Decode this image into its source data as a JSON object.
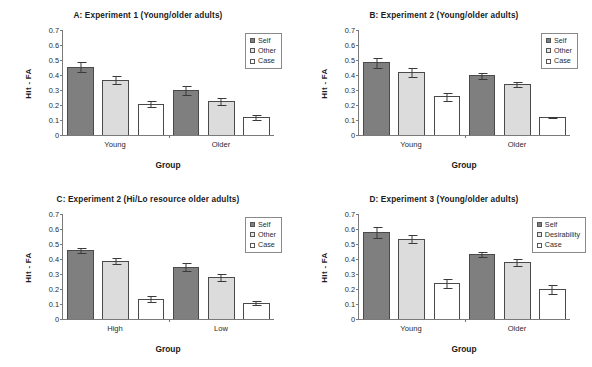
{
  "figure": {
    "panel_count": 4,
    "y_ticks": [
      "0.7",
      "0.6",
      "0.5",
      "0.4",
      "0.3",
      "0.2",
      "0.1",
      "0"
    ],
    "ylabel": "Hit - FA",
    "xlabel": "Group"
  },
  "panels": [
    {
      "id": "A",
      "title": "A:  Experiment 1 (Young/older adults)",
      "legend": [
        "Self",
        "Other",
        "Case"
      ],
      "categories": [
        "Young",
        "Older"
      ]
    },
    {
      "id": "B",
      "title": "B:  Experiment 2 (Young/older adults)",
      "legend": [
        "Self",
        "Other",
        "Case"
      ],
      "categories": [
        "Young",
        "Older"
      ]
    },
    {
      "id": "C",
      "title": "C:  Experiment 2 (Hi/Lo resource older adults)",
      "legend": [
        "Self",
        "Other",
        "Case"
      ],
      "categories": [
        "High",
        "Low"
      ]
    },
    {
      "id": "D",
      "title": "D:  Experiment 3 (Young/older adults)",
      "legend": [
        "Self",
        "Desirability",
        "Case"
      ],
      "categories": [
        "Young",
        "Older"
      ]
    }
  ],
  "chart_data": [
    {
      "type": "bar",
      "panel": "A",
      "title": "A:  Experiment 1 (Young/older adults)",
      "xlabel": "Group",
      "ylabel": "Hit - FA",
      "ylim": [
        0,
        0.7
      ],
      "ytick_step": 0.1,
      "grid": false,
      "legend_position": "top-right",
      "categories": [
        "Young",
        "Older"
      ],
      "series": [
        {
          "name": "Self",
          "color": "#7f7f7f",
          "values": [
            0.455,
            0.3
          ],
          "errors": [
            0.035,
            0.03
          ]
        },
        {
          "name": "Other",
          "color": "#dcdcdc",
          "values": [
            0.37,
            0.225
          ],
          "errors": [
            0.03,
            0.025
          ]
        },
        {
          "name": "Case",
          "color": "#ffffff",
          "values": [
            0.21,
            0.12
          ],
          "errors": [
            0.022,
            0.02
          ]
        }
      ]
    },
    {
      "type": "bar",
      "panel": "B",
      "title": "B:  Experiment 2 (Young/older adults)",
      "xlabel": "Group",
      "ylabel": "Hit - FA",
      "ylim": [
        0,
        0.7
      ],
      "ytick_step": 0.1,
      "grid": false,
      "legend_position": "top-right",
      "categories": [
        "Young",
        "Older"
      ],
      "series": [
        {
          "name": "Self",
          "color": "#7f7f7f",
          "values": [
            0.485,
            0.397
          ],
          "errors": [
            0.035,
            0.025
          ]
        },
        {
          "name": "Other",
          "color": "#dcdcdc",
          "values": [
            0.418,
            0.337
          ],
          "errors": [
            0.033,
            0.02
          ]
        },
        {
          "name": "Case",
          "color": "#ffffff",
          "values": [
            0.258,
            0.12
          ],
          "errors": [
            0.03,
            0.008
          ]
        }
      ]
    },
    {
      "type": "bar",
      "panel": "C",
      "title": "C:  Experiment 2 (Hi/Lo resource older adults)",
      "xlabel": "Group",
      "ylabel": "Hit - FA",
      "ylim": [
        0,
        0.7
      ],
      "ytick_step": 0.1,
      "grid": false,
      "legend_position": "top-right",
      "categories": [
        "High",
        "Low"
      ],
      "series": [
        {
          "name": "Self",
          "color": "#7f7f7f",
          "values": [
            0.458,
            0.35
          ],
          "errors": [
            0.02,
            0.027
          ]
        },
        {
          "name": "Other",
          "color": "#dcdcdc",
          "values": [
            0.39,
            0.28
          ],
          "errors": [
            0.02,
            0.025
          ]
        },
        {
          "name": "Case",
          "color": "#ffffff",
          "values": [
            0.135,
            0.11
          ],
          "errors": [
            0.022,
            0.017
          ]
        }
      ]
    },
    {
      "type": "bar",
      "panel": "D",
      "title": "D:  Experiment 3 (Young/older adults)",
      "xlabel": "Group",
      "ylabel": "Hit - FA",
      "ylim": [
        0,
        0.7
      ],
      "ytick_step": 0.1,
      "grid": false,
      "legend_position": "top-right",
      "categories": [
        "Young",
        "Older"
      ],
      "series": [
        {
          "name": "Self",
          "color": "#7f7f7f",
          "values": [
            0.58,
            0.433
          ],
          "errors": [
            0.042,
            0.022
          ]
        },
        {
          "name": "Desirability",
          "color": "#dcdcdc",
          "values": [
            0.535,
            0.38
          ],
          "errors": [
            0.03,
            0.025
          ]
        },
        {
          "name": "Case",
          "color": "#ffffff",
          "values": [
            0.24,
            0.2
          ],
          "errors": [
            0.03,
            0.032
          ]
        }
      ]
    }
  ]
}
